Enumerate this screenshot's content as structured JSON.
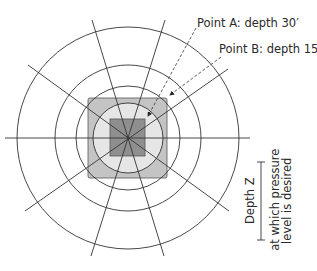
{
  "diagram": {
    "type": "pressure-bulb plan view",
    "center": {
      "x": 128,
      "y": 138
    },
    "circles": [
      {
        "r": 35,
        "fill": "#e6e6e6"
      },
      {
        "r": 52,
        "fill": "none"
      },
      {
        "r": 73,
        "fill": "none"
      },
      {
        "r": 111,
        "fill": "none"
      }
    ],
    "outer_square": {
      "x": 88,
      "y": 98,
      "w": 79,
      "h": 80,
      "fill": "#c4c4c4"
    },
    "inner_square": {
      "x": 110,
      "y": 119,
      "w": 35,
      "h": 37,
      "fill": "#8f8f8f"
    },
    "colors": {
      "line": "#3a3a3a",
      "light_fill": "#e6e6e6",
      "mid_fill": "#c4c4c4",
      "dark_fill": "#8f8f8f"
    }
  },
  "labels": {
    "point_a": "Point A: depth 30′",
    "point_b": "Point B: depth 15′",
    "depth_z": "Depth Z",
    "depth_desc_1": "at which pressure",
    "depth_desc_2": "level is desired"
  }
}
